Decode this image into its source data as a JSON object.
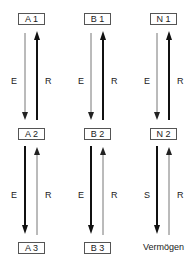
{
  "columns": [
    {
      "id": "A",
      "nodes": [
        "A 1",
        "A 2",
        "A 3"
      ],
      "upper_pair": {
        "down_label": "E",
        "up_label": "R",
        "emphasis": "up"
      },
      "lower_pair": {
        "down_label": "E",
        "up_label": "R",
        "emphasis": "down"
      }
    },
    {
      "id": "B",
      "nodes": [
        "B 1",
        "B 2",
        "B 3"
      ],
      "upper_pair": {
        "down_label": "E",
        "up_label": "R",
        "emphasis": "up"
      },
      "lower_pair": {
        "down_label": "E",
        "up_label": "R",
        "emphasis": "down"
      }
    },
    {
      "id": "N",
      "nodes": [
        "N 1",
        "N 2",
        "Vermögen"
      ],
      "upper_pair": {
        "down_label": "E",
        "up_label": "R",
        "emphasis": "up"
      },
      "lower_pair": {
        "down_label": "S",
        "up_label": "R",
        "emphasis": "down"
      }
    }
  ],
  "colors": {
    "thin_arrow": "#777777",
    "thick_arrow": "#111111",
    "box_border": "#555555"
  }
}
